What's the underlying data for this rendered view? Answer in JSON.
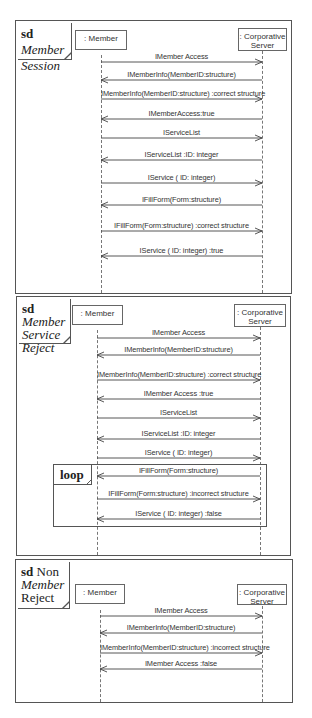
{
  "diagrams": [
    {
      "keyword": "sd",
      "title_lines": [
        {
          "parts": [
            {
              "text": "sd ",
              "style": "kw"
            },
            {
              "text": "Member",
              "style": "it"
            }
          ]
        },
        {
          "parts": [
            {
              "text": "Session",
              "style": "it"
            }
          ]
        }
      ],
      "lifelines": [
        ": Member",
        ": Corporative Server"
      ],
      "messages": [
        {
          "label": "IMember Access",
          "direction": "right"
        },
        {
          "label": "IMemberInfo(MemberID:structure)",
          "direction": "left"
        },
        {
          "label": "IMemberInfo(MemberID:structure) :correct structure",
          "direction": "right"
        },
        {
          "label": "IMemberAccess:true",
          "direction": "left"
        },
        {
          "label": "IServiceList",
          "direction": "right"
        },
        {
          "label": "IServiceList :ID: integer",
          "direction": "left"
        },
        {
          "label": "IService ( ID: integer)",
          "direction": "right"
        },
        {
          "label": "IFillForm(Form:structure)",
          "direction": "left"
        },
        {
          "label": "IFillForm(Form:structure) :correct structure",
          "direction": "right"
        },
        {
          "label": "IService ( ID: integer) :true",
          "direction": "left"
        }
      ]
    },
    {
      "keyword": "sd",
      "title_lines": [
        {
          "parts": [
            {
              "text": "sd ",
              "style": "kw"
            },
            {
              "text": "Member",
              "style": "it"
            }
          ]
        },
        {
          "parts": [
            {
              "text": "Service",
              "style": "it"
            }
          ]
        },
        {
          "parts": [
            {
              "text": "Reject",
              "style": "it"
            }
          ]
        }
      ],
      "lifelines": [
        ": Member",
        ": Corporative Server"
      ],
      "messages": [
        {
          "label": "IMember Access",
          "direction": "right"
        },
        {
          "label": "IMemberInfo(MemberID:structure)",
          "direction": "left"
        },
        {
          "label": "IMemberInfo(MemberID:structure) :correct structure",
          "direction": "right"
        },
        {
          "label": "IMember Access  :true",
          "direction": "left"
        },
        {
          "label": "IServiceList",
          "direction": "right"
        },
        {
          "label": "IServiceList :ID: integer",
          "direction": "left"
        },
        {
          "label": "IService ( ID: integer)",
          "direction": "right"
        },
        {
          "label": "IFillForm(Form:structure)",
          "direction": "left"
        },
        {
          "label": "IFillForm(Form:structure) :incorrect structure",
          "direction": "right"
        },
        {
          "label": "IService ( ID: integer) :false",
          "direction": "left"
        }
      ],
      "fragment": {
        "operator": "loop",
        "covers_messages": [
          7,
          8,
          9
        ]
      }
    },
    {
      "keyword": "sd",
      "title_lines": [
        {
          "parts": [
            {
              "text": "sd ",
              "style": "kw"
            },
            {
              "text": "Non",
              "style": ""
            }
          ]
        },
        {
          "parts": [
            {
              "text": "Member",
              "style": "it"
            }
          ]
        },
        {
          "parts": [
            {
              "text": "Reject",
              "style": ""
            }
          ]
        }
      ],
      "lifelines": [
        ": Member",
        ": Corporative Server"
      ],
      "messages": [
        {
          "label": "IMember Access",
          "direction": "right"
        },
        {
          "label": "IMemberInfo(MemberID:structure)",
          "direction": "left"
        },
        {
          "label": "IMemberInfo(MemberID:structure) :incorrect structure",
          "direction": "right"
        },
        {
          "label": "IMember Access  :false",
          "direction": "left"
        }
      ]
    }
  ]
}
